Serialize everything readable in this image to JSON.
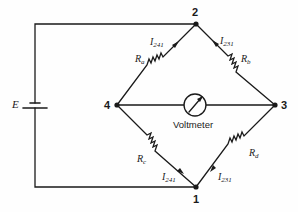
{
  "diagram": {
    "nodes": [
      {
        "id": "1",
        "label": "1"
      },
      {
        "id": "2",
        "label": "2"
      },
      {
        "id": "3",
        "label": "3"
      },
      {
        "id": "4",
        "label": "4"
      }
    ],
    "source": {
      "label": "E"
    },
    "resistors": {
      "ra": {
        "label": "R",
        "sub": "a"
      },
      "rb": {
        "label": "R",
        "sub": "b"
      },
      "rc": {
        "label": "R",
        "sub": "c"
      },
      "rd": {
        "label": "R",
        "sub": "d"
      }
    },
    "currents": {
      "top_left": {
        "label": "I",
        "sub": "241"
      },
      "top_right": {
        "label": "I",
        "sub": "231"
      },
      "bottom_left": {
        "label": "I",
        "sub": "241"
      },
      "bottom_right": {
        "label": "I",
        "sub": "231"
      }
    },
    "meter": {
      "label": "Voltmeter"
    },
    "colors": {
      "line": "#1a1a1a",
      "background": "#fefefe"
    }
  }
}
